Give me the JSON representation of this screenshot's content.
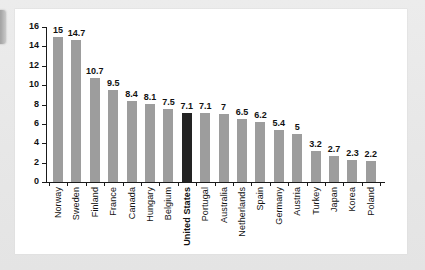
{
  "chart_data": {
    "type": "bar",
    "title": "",
    "subtitle": "",
    "xlabel": "",
    "ylabel": "",
    "ylim": [
      0,
      16
    ],
    "ytick_step": 2,
    "yticks": [
      16,
      14,
      12,
      10,
      8,
      6,
      4,
      2,
      0
    ],
    "grid": false,
    "legend": "none",
    "highlight_category": "United States",
    "bar_color": "#9d9d9d",
    "highlight_color": "#232323",
    "categories": [
      "Norway",
      "Sweden",
      "Finland",
      "France",
      "Canada",
      "Hungary",
      "Belgium",
      "United States",
      "Portugal",
      "Australia",
      "Netherlands",
      "Spain",
      "Germany",
      "Austria",
      "Turkey",
      "Japan",
      "Korea",
      "Poland"
    ],
    "values": [
      15,
      14.7,
      10.7,
      9.5,
      8.4,
      8.1,
      7.5,
      7.1,
      7.1,
      7,
      6.5,
      6.2,
      5.4,
      5,
      3.2,
      2.7,
      2.3,
      2.2
    ],
    "value_labels": [
      "15",
      "14.7",
      "10.7",
      "9.5",
      "8.4",
      "8.1",
      "7.5",
      "7.1",
      "7.1",
      "7",
      "6.5",
      "6.2",
      "5.4",
      "5",
      "3.2",
      "2.7",
      "2.3",
      "2.2"
    ]
  },
  "canvas": {
    "background_color": "#e9e9e9",
    "card_color": "#ffffff"
  }
}
